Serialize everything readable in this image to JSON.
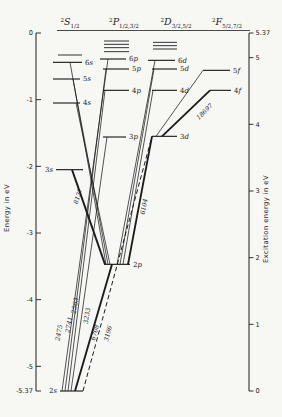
{
  "figure": {
    "width": 282,
    "height": 417,
    "background": "#f7f7f4",
    "ink": "#1c1c1c"
  },
  "left_axis": {
    "title": "Energy in eV",
    "x": 36,
    "y_top": 33,
    "y_bottom": 391,
    "ticks": [
      {
        "label": "0",
        "energy_ev": 0
      },
      {
        "label": "-1",
        "energy_ev": -1
      },
      {
        "label": "-2",
        "energy_ev": -2
      },
      {
        "label": "-3",
        "energy_ev": -3
      },
      {
        "label": "-4",
        "energy_ev": -4
      },
      {
        "label": "-5",
        "energy_ev": -5
      },
      {
        "label": "-5.37",
        "energy_ev": -5.37
      }
    ]
  },
  "right_axis": {
    "title": "Excitation energy in eV",
    "x": 249,
    "y_top": 33,
    "y_bottom": 391,
    "ticks": [
      {
        "label": "5.37",
        "excitation_ev": 5.37
      },
      {
        "label": "5",
        "excitation_ev": 5
      },
      {
        "label": "4",
        "excitation_ev": 4
      },
      {
        "label": "3",
        "excitation_ev": 3
      },
      {
        "label": "2",
        "excitation_ev": 2
      },
      {
        "label": "1",
        "excitation_ev": 1
      },
      {
        "label": "0",
        "excitation_ev": 0
      }
    ]
  },
  "chart_data": {
    "type": "energy-level-diagram",
    "energy_axis_range_ev": [
      0,
      -5.37
    ],
    "excitation_axis_range_ev": [
      5.37,
      0
    ],
    "ionization_limit_line": {
      "energy_ev": 0,
      "x1": 57,
      "x2": 250
    },
    "terms": [
      {
        "id": "S",
        "header": {
          "sup": "2",
          "letter": "S",
          "sub": "1/2"
        },
        "header_x": 70,
        "limit_lines": {
          "energies_ev": [
            -0.33
          ],
          "x1": 58,
          "x2": 82
        },
        "levels": [
          {
            "label": "2s",
            "energy_ev": -5.37,
            "x1": 60,
            "x2": 83,
            "label_side": "left"
          },
          {
            "label": "3s",
            "energy_ev": -2.05,
            "x1": 56,
            "x2": 83,
            "label_side": "left"
          },
          {
            "label": "4s",
            "energy_ev": -1.05,
            "x1": 53,
            "x2": 80,
            "label_side": "right"
          },
          {
            "label": "5s",
            "energy_ev": -0.69,
            "x1": 53,
            "x2": 80,
            "label_side": "right"
          },
          {
            "label": "6s",
            "energy_ev": -0.44,
            "x1": 53,
            "x2": 82,
            "label_side": "right"
          }
        ]
      },
      {
        "id": "P",
        "header": {
          "sup": "2",
          "letter": "P",
          "sub": "1/2,3/2"
        },
        "header_x": 124,
        "limit_lines": {
          "energies_ev": [
            -0.12,
            -0.17,
            -0.22,
            -0.28
          ],
          "x1": 104,
          "x2": 129
        },
        "levels": [
          {
            "label": "2p",
            "energy_ev": -3.47,
            "x1": 104,
            "x2": 130,
            "label_side": "right"
          },
          {
            "label": "3p",
            "energy_ev": -1.56,
            "x1": 103,
            "x2": 126,
            "label_side": "right"
          },
          {
            "label": "4p",
            "energy_ev": -0.86,
            "x1": 103,
            "x2": 129,
            "label_side": "right"
          },
          {
            "label": "5p",
            "energy_ev": -0.54,
            "x1": 103,
            "x2": 129,
            "label_side": "right"
          },
          {
            "label": "6p",
            "energy_ev": -0.39,
            "x1": 100,
            "x2": 126,
            "label_side": "right"
          }
        ]
      },
      {
        "id": "D",
        "header": {
          "sup": "2",
          "letter": "D",
          "sub": "3/2,5/2"
        },
        "header_x": 176,
        "limit_lines": {
          "energies_ev": [
            -0.14,
            -0.19,
            -0.24
          ],
          "x1": 153,
          "x2": 177
        },
        "levels": [
          {
            "label": "3d",
            "energy_ev": -1.55,
            "x1": 152,
            "x2": 177,
            "label_side": "right"
          },
          {
            "label": "4d",
            "energy_ev": -0.86,
            "x1": 152,
            "x2": 177,
            "label_side": "right"
          },
          {
            "label": "5d",
            "energy_ev": -0.54,
            "x1": 152,
            "x2": 177,
            "label_side": "right"
          },
          {
            "label": "6d",
            "energy_ev": -0.41,
            "x1": 148,
            "x2": 175,
            "label_side": "right"
          }
        ]
      },
      {
        "id": "F",
        "header": {
          "sup": "2",
          "letter": "F",
          "sub": "5/2,7/2"
        },
        "header_x": 227,
        "limit_lines": null,
        "levels": [
          {
            "label": "4f",
            "energy_ev": -0.86,
            "x1": 210,
            "x2": 231,
            "label_side": "right"
          },
          {
            "label": "5f",
            "energy_ev": -0.56,
            "x1": 203,
            "x2": 230,
            "label_side": "right"
          }
        ]
      }
    ],
    "transitions": [
      {
        "from": "6s",
        "x1": 70,
        "to": "2p",
        "x2": 106,
        "style": "thin",
        "wavelength": ""
      },
      {
        "from": "5s",
        "x1": 73,
        "to": "2p",
        "x2": 108,
        "style": "thin",
        "wavelength": ""
      },
      {
        "from": "4s",
        "x1": 76,
        "to": "2p",
        "x2": 110,
        "style": "thin",
        "wavelength": ""
      },
      {
        "from": "3s",
        "x1": 72,
        "to": "2p",
        "x2": 105,
        "style": "thick",
        "wavelength": "8127"
      },
      {
        "from": "2s",
        "x1": 62,
        "to": "6p",
        "x2": 108,
        "style": "thin",
        "wavelength": "2475"
      },
      {
        "from": "2s",
        "x1": 65,
        "to": "5p",
        "x2": 106,
        "style": "thin",
        "wavelength": "2563"
      },
      {
        "from": "2s",
        "x1": 68,
        "to": "4p",
        "x2": 105,
        "style": "thin",
        "wavelength": "2741"
      },
      {
        "from": "2s",
        "x1": 71,
        "to": "3p",
        "x2": 107,
        "style": "thin",
        "wavelength": "3233"
      },
      {
        "from": "2s",
        "x1": 75,
        "to": "2p",
        "x2": 112,
        "style": "thick",
        "wavelength": "6708"
      },
      {
        "from": "2s",
        "x1": 83,
        "to": "3d",
        "x2": 152,
        "style": "dashed",
        "wavelength": "3196"
      },
      {
        "from": "6d",
        "x1": 155,
        "to": "2p",
        "x2": 117,
        "style": "thin",
        "wavelength": ""
      },
      {
        "from": "5d",
        "x1": 154,
        "to": "2p",
        "x2": 120,
        "style": "thin",
        "wavelength": ""
      },
      {
        "from": "4d",
        "x1": 153,
        "to": "2p",
        "x2": 123,
        "style": "thin",
        "wavelength": ""
      },
      {
        "from": "3d",
        "x1": 152,
        "to": "2p",
        "x2": 128,
        "style": "thick",
        "wavelength": "6104"
      },
      {
        "from": "3d",
        "x1": 162,
        "to": "4f",
        "x2": 210,
        "style": "thick",
        "wavelength": "18697"
      },
      {
        "from": "3d",
        "x1": 156,
        "to": "5f",
        "x2": 203,
        "style": "thin",
        "wavelength": ""
      }
    ],
    "wavelength_labels": [
      {
        "text": "2475",
        "x": 61,
        "y": 333,
        "angle": -80
      },
      {
        "text": "2741",
        "x": 71,
        "y": 325,
        "angle": -80
      },
      {
        "text": "2563",
        "x": 77,
        "y": 306,
        "angle": -80
      },
      {
        "text": "3233",
        "x": 89,
        "y": 316,
        "angle": -81
      },
      {
        "text": "6708",
        "x": 97,
        "y": 333,
        "angle": -74
      },
      {
        "text": "3196",
        "x": 110,
        "y": 334,
        "angle": -75
      },
      {
        "text": "8127",
        "x": 80,
        "y": 197,
        "angle": -71
      },
      {
        "text": "6104",
        "x": 146,
        "y": 207,
        "angle": -79
      },
      {
        "text": "18697",
        "x": 206,
        "y": 113,
        "angle": -44
      }
    ]
  }
}
